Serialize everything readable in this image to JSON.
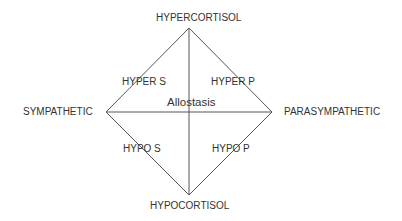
{
  "diagram": {
    "vertices": {
      "top": "HYPERCORTISOL",
      "bottom": "HYPOCORTISOL",
      "left": "SYMPATHETIC",
      "right": "PARASYMPATHETIC"
    },
    "quadrants": {
      "upper_left": "HYPER S",
      "upper_right": "HYPER P",
      "lower_left": "HYPO S",
      "lower_right": "HYPO P"
    },
    "center": "Allostasis",
    "colors": {
      "line": "#555555",
      "text": "#333333",
      "background": "#ffffff"
    }
  }
}
